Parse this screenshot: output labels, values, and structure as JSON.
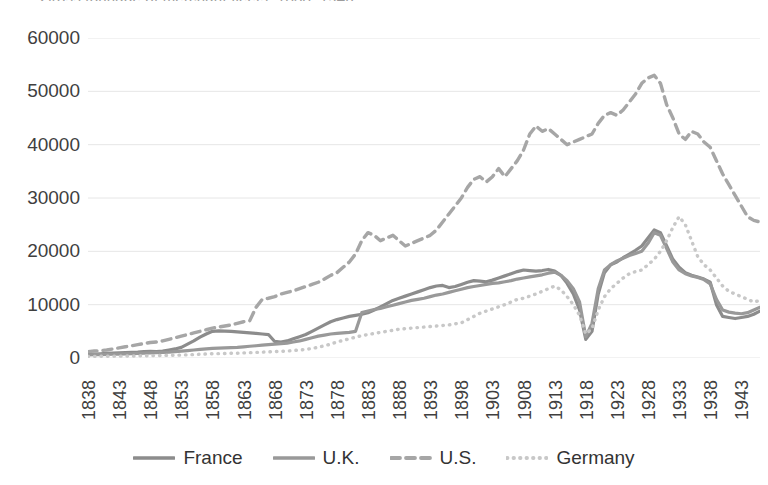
{
  "chart_data": {
    "type": "line",
    "title": "Gross tonnage of merchant fleets, 1838–1946",
    "xlabel": "",
    "ylabel": "",
    "ylim": [
      0,
      60000
    ],
    "ytick_labels": [
      "60000",
      "50000",
      "40000",
      "30000",
      "20000",
      "10000",
      "0"
    ],
    "ytick_values": [
      60000,
      50000,
      40000,
      30000,
      20000,
      10000,
      0
    ],
    "xlim": [
      1838,
      1946
    ],
    "xtick_labels": [
      "1838",
      "1843",
      "1848",
      "1853",
      "1858",
      "1863",
      "1868",
      "1873",
      "1878",
      "1883",
      "1888",
      "1893",
      "1898",
      "1903",
      "1908",
      "1913",
      "1918",
      "1923",
      "1928",
      "1933",
      "1938",
      "1943"
    ],
    "xtick_values": [
      1838,
      1843,
      1848,
      1853,
      1858,
      1863,
      1868,
      1873,
      1878,
      1883,
      1888,
      1893,
      1898,
      1903,
      1908,
      1913,
      1918,
      1923,
      1928,
      1933,
      1938,
      1943
    ],
    "grid": "horizontal",
    "legend_position": "bottom",
    "x": [
      1838,
      1839,
      1840,
      1841,
      1842,
      1843,
      1844,
      1845,
      1846,
      1847,
      1848,
      1849,
      1850,
      1851,
      1852,
      1853,
      1854,
      1855,
      1856,
      1857,
      1858,
      1859,
      1860,
      1861,
      1862,
      1863,
      1864,
      1865,
      1866,
      1867,
      1868,
      1869,
      1870,
      1871,
      1872,
      1873,
      1874,
      1875,
      1876,
      1877,
      1878,
      1879,
      1880,
      1881,
      1882,
      1883,
      1884,
      1885,
      1886,
      1887,
      1888,
      1889,
      1890,
      1891,
      1892,
      1893,
      1894,
      1895,
      1896,
      1897,
      1898,
      1899,
      1900,
      1901,
      1902,
      1903,
      1904,
      1905,
      1906,
      1907,
      1908,
      1909,
      1910,
      1911,
      1912,
      1913,
      1914,
      1915,
      1916,
      1917,
      1918,
      1919,
      1920,
      1921,
      1922,
      1923,
      1924,
      1925,
      1926,
      1927,
      1928,
      1929,
      1930,
      1931,
      1932,
      1933,
      1934,
      1935,
      1936,
      1937,
      1938,
      1939,
      1940,
      1941,
      1942,
      1943,
      1944,
      1945,
      1946
    ],
    "series": [
      {
        "name": "France",
        "color": "#8c8c8c",
        "style": "solid",
        "width": 3.2,
        "values": [
          700,
          750,
          800,
          850,
          900,
          950,
          1000,
          1050,
          1100,
          1200,
          1250,
          1200,
          1300,
          1500,
          1700,
          2000,
          2600,
          3200,
          3900,
          4500,
          5000,
          5100,
          5050,
          5000,
          4900,
          4800,
          4700,
          4600,
          4500,
          4400,
          3100,
          3000,
          3200,
          3600,
          4000,
          4400,
          5000,
          5600,
          6200,
          6800,
          7200,
          7500,
          7800,
          8000,
          8200,
          8500,
          9000,
          9600,
          10200,
          10800,
          11200,
          11600,
          12000,
          12400,
          12800,
          13200,
          13500,
          13600,
          13200,
          13400,
          13800,
          14200,
          14500,
          14400,
          14300,
          14600,
          15000,
          15400,
          15800,
          16200,
          16500,
          16400,
          16300,
          16400,
          16600,
          16300,
          15500,
          14000,
          12000,
          9000,
          3500,
          5000,
          12000,
          16000,
          17500,
          18000,
          18800,
          19500,
          20200,
          21000,
          22500,
          24000,
          23500,
          21000,
          18500,
          17000,
          16000,
          15500,
          15200,
          14800,
          14200,
          10000,
          7800,
          7600,
          7400,
          7600,
          7800,
          8200,
          8800
        ]
      },
      {
        "name": "U.K.",
        "color": "#999999",
        "style": "solid",
        "width": 3.2,
        "values": [
          600,
          620,
          640,
          680,
          700,
          720,
          760,
          800,
          850,
          900,
          950,
          1000,
          1050,
          1100,
          1200,
          1300,
          1400,
          1500,
          1600,
          1700,
          1800,
          1850,
          1900,
          1950,
          2000,
          2100,
          2200,
          2300,
          2400,
          2500,
          2600,
          2700,
          2800,
          3000,
          3200,
          3500,
          3800,
          4100,
          4300,
          4500,
          4600,
          4700,
          4800,
          5000,
          8500,
          8800,
          9100,
          9300,
          9600,
          9900,
          10200,
          10500,
          10800,
          11000,
          11200,
          11500,
          11800,
          12000,
          12300,
          12600,
          12900,
          13200,
          13400,
          13600,
          13800,
          14000,
          14100,
          14300,
          14500,
          14800,
          15000,
          15200,
          15400,
          15600,
          15900,
          16100,
          15500,
          14500,
          13000,
          10500,
          4000,
          6500,
          13000,
          16500,
          17500,
          18200,
          18700,
          19200,
          19600,
          20000,
          21500,
          23500,
          23000,
          20500,
          18000,
          16500,
          15800,
          15400,
          15100,
          14700,
          13900,
          11000,
          9000,
          8600,
          8400,
          8300,
          8500,
          9000,
          9500
        ]
      },
      {
        "name": "U.S.",
        "color": "#a6a6a6",
        "style": "dashed",
        "width": 3.4,
        "values": [
          1200,
          1300,
          1400,
          1500,
          1700,
          1900,
          2100,
          2300,
          2500,
          2700,
          2900,
          3000,
          3200,
          3500,
          3800,
          4100,
          4400,
          4700,
          5000,
          5300,
          5600,
          5800,
          6000,
          6200,
          6500,
          6800,
          7000,
          9500,
          11000,
          11200,
          11500,
          12000,
          12300,
          12600,
          13000,
          13400,
          13800,
          14200,
          14800,
          15500,
          16000,
          17000,
          18000,
          19500,
          22000,
          23500,
          23000,
          22000,
          22500,
          23000,
          22000,
          21000,
          21500,
          22000,
          22500,
          23000,
          24000,
          25500,
          27000,
          28500,
          30000,
          32000,
          33500,
          34000,
          33000,
          34000,
          35500,
          34000,
          35500,
          37000,
          39000,
          42000,
          43500,
          42500,
          43000,
          42000,
          41000,
          40000,
          40500,
          41000,
          41500,
          42000,
          44000,
          45500,
          46000,
          45500,
          46500,
          48000,
          49500,
          51500,
          52500,
          53000,
          51500,
          47500,
          45000,
          42000,
          41000,
          42500,
          42000,
          40500,
          39500,
          37000,
          34500,
          32500,
          30500,
          28500,
          26500,
          25800,
          25500
        ]
      },
      {
        "name": "Germany",
        "color": "#c8c8c8",
        "style": "dotted",
        "width": 3.4,
        "values": [
          300,
          310,
          320,
          330,
          340,
          350,
          360,
          380,
          400,
          420,
          440,
          460,
          480,
          500,
          520,
          560,
          600,
          650,
          700,
          750,
          800,
          820,
          850,
          880,
          900,
          950,
          1000,
          1050,
          1100,
          1150,
          1200,
          1250,
          1300,
          1400,
          1500,
          1600,
          1800,
          2000,
          2300,
          2600,
          3000,
          3300,
          3600,
          3900,
          4200,
          4400,
          4600,
          4800,
          5000,
          5200,
          5400,
          5500,
          5600,
          5700,
          5800,
          5900,
          6000,
          6100,
          6200,
          6400,
          6600,
          7200,
          7800,
          8400,
          8800,
          9200,
          9600,
          10000,
          10500,
          11000,
          11200,
          11600,
          12000,
          12500,
          13000,
          13500,
          12800,
          11500,
          10000,
          8000,
          4500,
          5500,
          9000,
          11500,
          13000,
          14000,
          15000,
          15800,
          16200,
          16500,
          17500,
          18500,
          20000,
          22000,
          24500,
          26500,
          25000,
          22000,
          19000,
          17500,
          16500,
          15000,
          13500,
          12500,
          12000,
          11500,
          11000,
          10500,
          10800
        ]
      }
    ]
  },
  "legend": [
    {
      "label": "France",
      "swatch": "legend-swatch-france"
    },
    {
      "label": "U.K.",
      "swatch": "legend-swatch-uk"
    },
    {
      "label": "U.S.",
      "swatch": "legend-swatch-us"
    },
    {
      "label": "Germany",
      "swatch": "legend-swatch-germany"
    }
  ],
  "style": {
    "gridline_color": "#e6e6e6",
    "axis_text_color": "#3f3f3f",
    "background": "#ffffff"
  }
}
